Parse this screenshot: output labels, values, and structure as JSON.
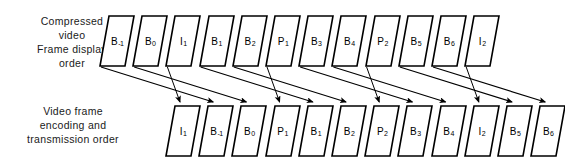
{
  "diagram": {
    "labels": {
      "display_order": "Compressed\nvideo\nFrame display\norder",
      "transmission_order": "Video frame\nencoding and\ntransmission order"
    },
    "colors": {
      "frame_stroke": "#000000",
      "frame_fill": "#ffffff",
      "arrow": "#000000",
      "text": "#000000"
    },
    "geometry": {
      "frame_width": 34,
      "frame_height": 50,
      "frame_spacing": 33.2,
      "top_row_y": 16,
      "bottom_row_y": 106,
      "first_frame_x": 100,
      "bottom_first_frame_x": 166
    },
    "display_row": {
      "row_label": "display",
      "frames": [
        {
          "type": "B",
          "index": "-1",
          "label": "B",
          "sub": "-1"
        },
        {
          "type": "B",
          "index": "0",
          "label": "B",
          "sub": "0"
        },
        {
          "type": "I",
          "index": "1",
          "label": "I",
          "sub": "1"
        },
        {
          "type": "B",
          "index": "1",
          "label": "B",
          "sub": "1"
        },
        {
          "type": "B",
          "index": "2",
          "label": "B",
          "sub": "2"
        },
        {
          "type": "P",
          "index": "1",
          "label": "P",
          "sub": "1"
        },
        {
          "type": "B",
          "index": "3",
          "label": "B",
          "sub": "3"
        },
        {
          "type": "B",
          "index": "4",
          "label": "B",
          "sub": "4"
        },
        {
          "type": "P",
          "index": "2",
          "label": "P",
          "sub": "2"
        },
        {
          "type": "B",
          "index": "5",
          "label": "B",
          "sub": "5"
        },
        {
          "type": "B",
          "index": "6",
          "label": "B",
          "sub": "6"
        },
        {
          "type": "I",
          "index": "2",
          "label": "I",
          "sub": "2"
        }
      ]
    },
    "transmission_row": {
      "row_label": "transmission",
      "frames": [
        {
          "type": "I",
          "index": "1",
          "label": "I",
          "sub": "1"
        },
        {
          "type": "B",
          "index": "-1",
          "label": "B",
          "sub": "-1"
        },
        {
          "type": "B",
          "index": "0",
          "label": "B",
          "sub": "0"
        },
        {
          "type": "P",
          "index": "1",
          "label": "P",
          "sub": "1"
        },
        {
          "type": "B",
          "index": "1",
          "label": "B",
          "sub": "1"
        },
        {
          "type": "B",
          "index": "2",
          "label": "B",
          "sub": "2"
        },
        {
          "type": "P",
          "index": "2",
          "label": "P",
          "sub": "2"
        },
        {
          "type": "B",
          "index": "3",
          "label": "B",
          "sub": "3"
        },
        {
          "type": "B",
          "index": "4",
          "label": "B",
          "sub": "4"
        },
        {
          "type": "I",
          "index": "2",
          "label": "I",
          "sub": "2"
        },
        {
          "type": "B",
          "index": "5",
          "label": "B",
          "sub": "5"
        },
        {
          "type": "B",
          "index": "6",
          "label": "B",
          "sub": "6"
        }
      ]
    },
    "mappings": [
      {
        "from": 0,
        "to": 1,
        "kind": "diagonal"
      },
      {
        "from": 1,
        "to": 2,
        "kind": "diagonal"
      },
      {
        "from": 2,
        "to": 0,
        "kind": "vertical"
      },
      {
        "from": 3,
        "to": 4,
        "kind": "diagonal"
      },
      {
        "from": 4,
        "to": 5,
        "kind": "diagonal"
      },
      {
        "from": 5,
        "to": 3,
        "kind": "vertical"
      },
      {
        "from": 6,
        "to": 7,
        "kind": "diagonal"
      },
      {
        "from": 7,
        "to": 8,
        "kind": "diagonal"
      },
      {
        "from": 8,
        "to": 6,
        "kind": "vertical"
      },
      {
        "from": 9,
        "to": 10,
        "kind": "diagonal"
      },
      {
        "from": 10,
        "to": 11,
        "kind": "diagonal"
      },
      {
        "from": 11,
        "to": 9,
        "kind": "vertical"
      }
    ]
  }
}
